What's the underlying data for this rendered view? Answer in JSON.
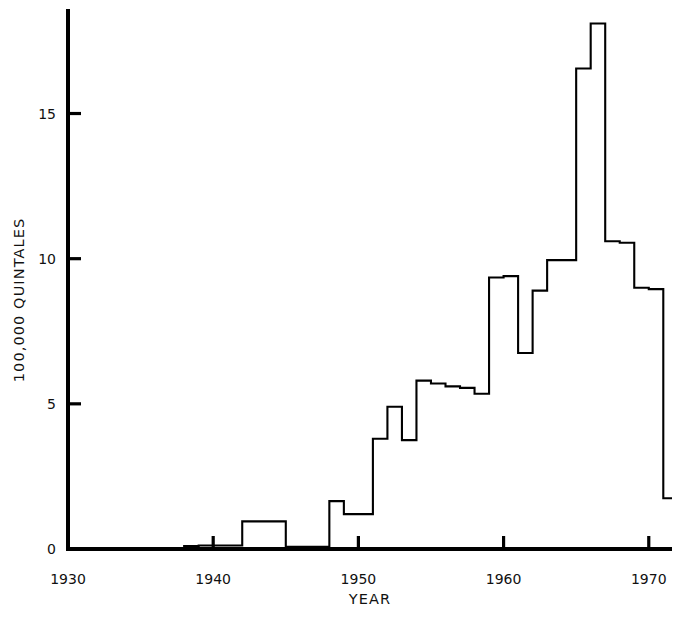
{
  "chart_data": {
    "type": "line",
    "style": "step-post",
    "title": "",
    "subtitle": "",
    "xlabel": "YEAR",
    "ylabel": "100,000 QUINTALES",
    "xlim": [
      1930,
      1971.6
    ],
    "ylim": [
      0,
      18.6
    ],
    "grid": false,
    "legend": null,
    "xticks": [
      1930,
      1940,
      1950,
      1960,
      1970
    ],
    "xtick_labels": [
      "1930",
      "1940",
      "1950",
      "1960",
      "1970"
    ],
    "yticks": [
      0,
      5,
      10,
      15
    ],
    "ytick_labels": [
      "0",
      "5",
      "10",
      "15"
    ],
    "line_color": "#000000",
    "line_width": 2.0,
    "background": "#ffffff",
    "x": [
      1930,
      1931,
      1932,
      1933,
      1934,
      1935,
      1936,
      1937,
      1938,
      1939,
      1940,
      1941,
      1942,
      1943,
      1944,
      1945,
      1946,
      1947,
      1948,
      1949,
      1950,
      1951,
      1952,
      1953,
      1954,
      1955,
      1956,
      1957,
      1958,
      1959,
      1960,
      1961,
      1962,
      1963,
      1964,
      1965,
      1966,
      1967,
      1968,
      1969,
      1970,
      1971
    ],
    "values": [
      0,
      0,
      0,
      0,
      0,
      0,
      0,
      0,
      0.1,
      0.12,
      0.12,
      0.12,
      0.95,
      0.95,
      0.95,
      0.08,
      0.08,
      0.08,
      1.65,
      1.2,
      1.2,
      3.8,
      4.9,
      3.75,
      5.8,
      5.7,
      5.6,
      5.55,
      5.35,
      9.35,
      9.4,
      6.75,
      8.9,
      9.95,
      9.95,
      16.55,
      18.1,
      10.6,
      10.55,
      9.0,
      8.95,
      1.75
    ],
    "annotations": []
  },
  "axes": {
    "y_axis_title": "100,000 QUINTALES",
    "x_axis_title": "YEAR"
  }
}
